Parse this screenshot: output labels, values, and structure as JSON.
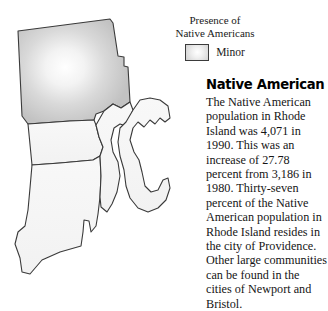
{
  "legend": {
    "title_line_1": "Presence of",
    "title_line_2": "Native Americans",
    "swatch_icon": "legend-swatch-gradient",
    "category_label": "Minor",
    "swatch_color": "#c8c8c8",
    "swatch_border_color": "#3b3b3b"
  },
  "article": {
    "heading": "Native American",
    "body": "The Native American population in Rhode Island was 4,071 in 1990. This was an increase of 27.78 percent from 3,186 in 1980. Thirty-seven percent of the Native American population in Rhode Island resides in the city of Providence. Other large communities can be found in the cities of Newport and Bristol."
  },
  "map": {
    "icon": "rhode-island-county-map",
    "background_color": "#ffffff",
    "outline_color": "#3a3a3a",
    "shaded_region_color": "#c8c8c8",
    "unshaded_region_color": "#f6f6f6",
    "regions": [
      {
        "name": "northern-county",
        "shading": "Minor",
        "fill": "#c8c8c8"
      },
      {
        "name": "west-central-county",
        "shading": "none",
        "fill": "#f6f6f6"
      },
      {
        "name": "southwest-county",
        "shading": "none",
        "fill": "#f6f6f6"
      },
      {
        "name": "east-bay-county",
        "shading": "none",
        "fill": "#f6f6f6"
      },
      {
        "name": "island-county",
        "shading": "none",
        "fill": "#f6f6f6"
      }
    ]
  }
}
